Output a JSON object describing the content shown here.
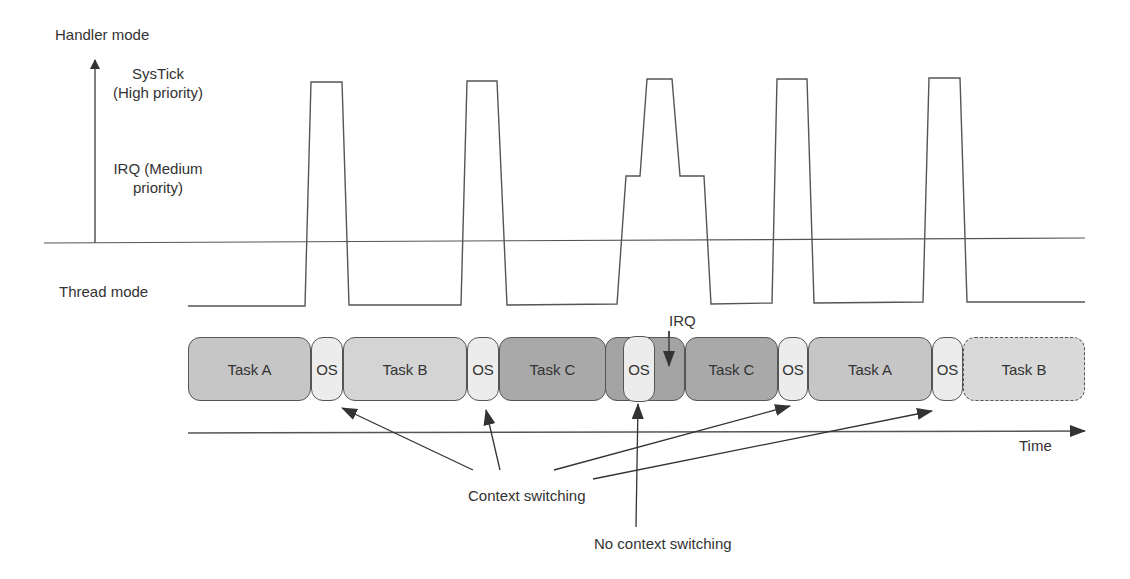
{
  "labels": {
    "handler_mode": "Handler mode",
    "systick_line1": "SysTick",
    "systick_line2": "(High priority)",
    "irq_line1": "IRQ (Medium",
    "irq_line2": "priority)",
    "thread_mode": "Thread mode",
    "irq_marker": "IRQ",
    "time_axis": "Time",
    "context_switching": "Context switching",
    "no_context_switching": "No context switching"
  },
  "timeline": [
    {
      "label": "Task A",
      "kind": "task-a"
    },
    {
      "label": "OS",
      "kind": "os"
    },
    {
      "label": "Task B",
      "kind": "task-b"
    },
    {
      "label": "OS",
      "kind": "os"
    },
    {
      "label": "Task C",
      "kind": "task-c"
    },
    {
      "label": "OS",
      "kind": "os-in-irq"
    },
    {
      "label": "Task C",
      "kind": "task-c"
    },
    {
      "label": "OS",
      "kind": "os"
    },
    {
      "label": "Task A",
      "kind": "task-a"
    },
    {
      "label": "OS",
      "kind": "os"
    },
    {
      "label": "Task B",
      "kind": "task-b-future"
    }
  ],
  "colors": {
    "line": "#555555",
    "task_a": "#c6c6c6",
    "task_b": "#d4d4d4",
    "task_c": "#a9a9a9",
    "os": "#ececec",
    "irq": "#a3a3a3"
  }
}
